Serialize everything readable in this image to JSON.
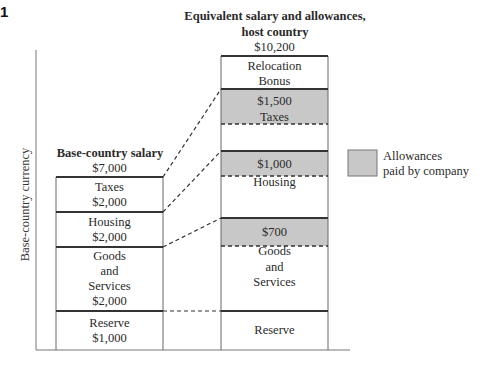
{
  "figure_number": "1",
  "y_axis_label": "Base-country currency",
  "base": {
    "title": "Base-country salary",
    "total": "$7,000",
    "segments": [
      {
        "label": "Taxes",
        "value": "$2,000"
      },
      {
        "label": "Housing",
        "value": "$2,000"
      },
      {
        "label_lines": [
          "Goods",
          "and",
          "Services"
        ],
        "value": "$2,000"
      },
      {
        "label": "Reserve",
        "value": "$1,000"
      }
    ]
  },
  "host": {
    "title_line1": "Equivalent salary and allowances,",
    "title_line2": "host country",
    "total": "$10,200",
    "segments": [
      {
        "label_line1": "Relocation",
        "label_line2": "Bonus"
      },
      {
        "allowance": "$1,500",
        "label": "Taxes"
      },
      {
        "allowance": "$1,000",
        "label": "Housing"
      },
      {
        "allowance": "$700",
        "label_lines": [
          "Goods",
          "and",
          "Services"
        ]
      },
      {
        "label": "Reserve"
      }
    ]
  },
  "legend": {
    "line1": "Allowances",
    "line2": "paid by company",
    "color": "#c8c8c8"
  },
  "colors": {
    "allowance_fill": "#c8c8c8",
    "line": "#333333"
  }
}
